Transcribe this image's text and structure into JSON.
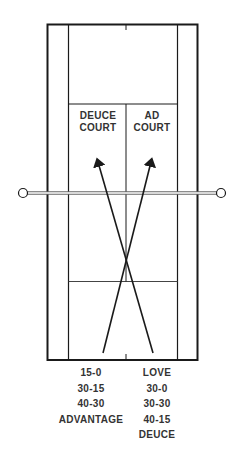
{
  "diagram": {
    "court_labels": {
      "deuce": [
        "DEUCE",
        "COURT"
      ],
      "ad": [
        "AD",
        "COURT"
      ]
    },
    "deuce_court_scores": [
      "15-0",
      "30-15",
      "40-30",
      "ADVANTAGE"
    ],
    "ad_court_scores": [
      "LOVE",
      "30-0",
      "30-30",
      "40-15",
      "DEUCE"
    ],
    "colors": {
      "line": "#1a1a1a",
      "net": "#555555",
      "background": "#ffffff"
    }
  }
}
